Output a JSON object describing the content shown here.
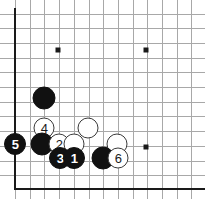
{
  "figure": {
    "kind": "go-board-diagram",
    "width": 205,
    "height": 199,
    "background_color": "#ffffff",
    "grid_line_color": "#a8a8a8",
    "board_edge_color": "#1a1a1a",
    "black_stone_color": "#111111",
    "white_stone_color": "#ffffff",
    "white_stone_outline_color": "#3a3a3a"
  },
  "board": {
    "origin_x": 15,
    "origin_y": 13.5,
    "spacing": 14.7,
    "columns_visible": 13,
    "rows_visible": 12,
    "left_edge_x": 15,
    "bottom_edge_y": 188,
    "left_edge_visible": true,
    "bottom_edge_visible": true,
    "top_edge_visible": false,
    "right_edge_visible": false
  },
  "star_points": [
    {
      "name": "star-point-upper-left",
      "x": 58,
      "y": 50
    },
    {
      "name": "star-point-upper-right",
      "x": 146,
      "y": 50
    },
    {
      "name": "star-point-lower-right",
      "x": 146,
      "y": 147
    }
  ],
  "stones": [
    {
      "name": "stone-black-plain-upper",
      "color": "black",
      "x": 44,
      "y": 98,
      "diameter": 23,
      "label": ""
    },
    {
      "name": "stone-white-move-4",
      "color": "white",
      "x": 44,
      "y": 128,
      "diameter": 21,
      "label": "4"
    },
    {
      "name": "stone-white-plain-upper-right",
      "color": "white",
      "x": 88,
      "y": 128,
      "diameter": 21,
      "label": ""
    },
    {
      "name": "stone-black-move-5",
      "color": "black",
      "x": 15,
      "y": 144,
      "diameter": 22,
      "label": "5"
    },
    {
      "name": "stone-black-plain-left",
      "color": "black",
      "x": 42,
      "y": 144,
      "diameter": 23,
      "label": ""
    },
    {
      "name": "stone-white-move-2",
      "color": "white",
      "x": 59,
      "y": 144,
      "diameter": 21,
      "label": "2"
    },
    {
      "name": "stone-white-plain-middle",
      "color": "white",
      "x": 74,
      "y": 144,
      "diameter": 21,
      "label": ""
    },
    {
      "name": "stone-white-plain-right",
      "color": "white",
      "x": 117,
      "y": 144,
      "diameter": 21,
      "label": ""
    },
    {
      "name": "stone-black-move-3",
      "color": "black",
      "x": 60,
      "y": 158,
      "diameter": 22,
      "label": "3"
    },
    {
      "name": "stone-black-move-1",
      "color": "black",
      "x": 74,
      "y": 158,
      "diameter": 22,
      "label": "1"
    },
    {
      "name": "stone-black-plain-bottom",
      "color": "black",
      "x": 103,
      "y": 158,
      "diameter": 23,
      "label": ""
    },
    {
      "name": "stone-white-move-6",
      "color": "white",
      "x": 118,
      "y": 158,
      "diameter": 21,
      "label": "6"
    }
  ]
}
